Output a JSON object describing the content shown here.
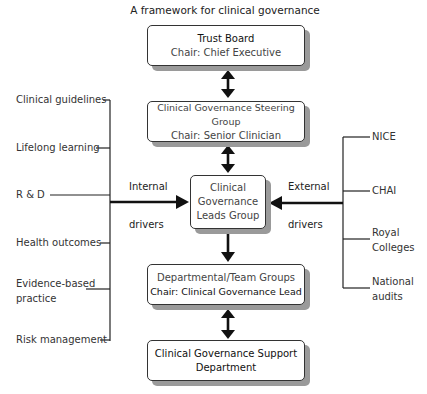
{
  "title": "A framework for clinical governance",
  "boxes": {
    "trust_board": {
      "line1": "Trust Board",
      "line2": "Chair: Chief Executive"
    },
    "steering_group": {
      "line1": "Clinical Governance Steering Group",
      "line2": "Chair: Senior Clinician"
    },
    "leads_group": {
      "line1": "Clinical",
      "line2": "Governance",
      "line3": "Leads Group"
    },
    "departmental": {
      "line1": "Departmental/Team Groups",
      "line2": "Chair: Clinical Governance Lead"
    },
    "support": {
      "line1": "Clinical Governance Support",
      "line2": "Department"
    }
  },
  "internal_drivers": {
    "label_top": "Internal",
    "label_bottom": "drivers",
    "items": [
      {
        "line1": "Clinical guidelines"
      },
      {
        "line1": "Lifelong learning"
      },
      {
        "line1": "R & D"
      },
      {
        "line1": "Health outcomes"
      },
      {
        "line1": "Evidence-based",
        "line2": "practice"
      },
      {
        "line1": "Risk management"
      }
    ]
  },
  "external_drivers": {
    "label_top": "External",
    "label_bottom": "drivers",
    "items": [
      {
        "line1": "NICE"
      },
      {
        "line1": "CHAI"
      },
      {
        "line1": "Royal",
        "line2": "Colleges"
      },
      {
        "line1": "National",
        "line2": "audits"
      }
    ]
  },
  "colors": {
    "line": "#111111",
    "box_border": "#333333",
    "box_shadow": "#9a9a9a",
    "text": "#2a2a2a"
  }
}
